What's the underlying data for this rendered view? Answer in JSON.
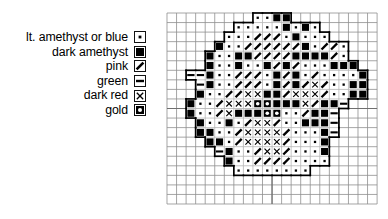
{
  "legend": {
    "items": [
      {
        "label": "lt. amethyst or blue",
        "symbol": "dot",
        "symbol_name": "small-dot-symbol",
        "color": "#000000"
      },
      {
        "label": "dark amethyst",
        "symbol": "filled-square",
        "symbol_name": "filled-square-symbol",
        "color": "#000000"
      },
      {
        "label": "pink",
        "symbol": "slash",
        "symbol_name": "diagonal-slash-symbol",
        "color": "#000000"
      },
      {
        "label": "green",
        "symbol": "dash",
        "symbol_name": "horizontal-dash-symbol",
        "color": "#000000"
      },
      {
        "label": "dark red",
        "symbol": "cross",
        "symbol_name": "x-cross-symbol",
        "color": "#000000"
      },
      {
        "label": "gold",
        "symbol": "ring",
        "symbol_name": "filled-ring-symbol",
        "color": "#000000"
      }
    ]
  },
  "chart_data": {
    "type": "heatmap",
    "title": "",
    "xlabel": "",
    "ylabel": "",
    "columns": 22,
    "rows": 20,
    "cell_size": 9.55,
    "grid": true,
    "grid_color": "#8f8f8f",
    "center_line_color": "#6f6f6f",
    "outline_color": "#000000",
    "center_column_index": 11,
    "center_row_index": 10,
    "symbol_legend": {
      "0": "empty",
      "d": "dot",
      "b": "filled-square",
      "s": "slash",
      "h": "dash",
      "x": "cross",
      "o": "ring"
    },
    "cells": [
      "000000000ddbb0000000000",
      "0000000dddddbdbd000000",
      "000000dddsssdbddd00000",
      "00000bddssssssbdssd000",
      "0000bddbbssssbbbbsd000",
      "0000bddbddbsbsdddbbb00",
      "00hhbddsssdbsbdsddddb0",
      "000hbddsssdbsbsxsddbb0",
      "000bddssxxbbsxxxsddbb0",
      "00bddsxxxoobbbxsbbh000",
      "00bddsxbbbooddsbbh0000",
      "000bddbdsxxsddbbbh0000",
      "000bbddsxxxxsdddbh0000",
      "0000bbdsxxxxsdddb00000",
      "00000hbddsxxsdddb00000",
      "000000bddssssdddd00000",
      "0000000dddddddd0000000",
      "0000000000000000000000",
      "0000000000000000000000",
      "0000000000000000000000"
    ],
    "colors_represented": [
      "lt. amethyst or blue",
      "dark amethyst",
      "pink",
      "green",
      "dark red",
      "gold"
    ]
  }
}
